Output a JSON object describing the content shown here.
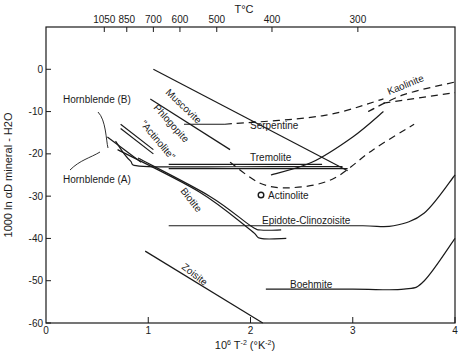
{
  "chart_data": {
    "type": "line",
    "title": "",
    "xlabel": "10^6 T^-2 (°K^-2)",
    "ylabel": "1000 ln αD mineral - H2O",
    "top_axis_label": "T°C",
    "xlim": [
      0,
      4
    ],
    "ylim": [
      -60,
      10
    ],
    "grid": false,
    "legend": "none (curves labeled inline)",
    "x_ticks": [
      0,
      1,
      2,
      3,
      4
    ],
    "x_tick_labels": [
      "0",
      "1",
      "2",
      "3",
      "4"
    ],
    "y_ticks": [
      0,
      -10,
      -20,
      -30,
      -40,
      -50,
      -60
    ],
    "y_tick_labels": [
      "0",
      "-10",
      "-20",
      "-30",
      "-40",
      "-50",
      "-60"
    ],
    "top_ticks": [
      {
        "label": "1050",
        "x": 0.57
      },
      {
        "label": "850",
        "x": 0.79
      },
      {
        "label": "700",
        "x": 1.05
      },
      {
        "label": "600",
        "x": 1.31
      },
      {
        "label": "500",
        "x": 1.67
      },
      {
        "label": "400",
        "x": 2.21
      },
      {
        "label": "300",
        "x": 3.05
      }
    ],
    "series": [
      {
        "name": "Muscovite",
        "style": "solid",
        "points": [
          [
            1.05,
            0
          ],
          [
            2.95,
            -24
          ]
        ]
      },
      {
        "name": "Phlogopite",
        "style": "solid",
        "points": [
          [
            1.02,
            -7
          ],
          [
            1.8,
            -19
          ]
        ]
      },
      {
        "name": "\"Actinolite\"",
        "style": "solid",
        "points": [
          [
            0.73,
            -13
          ],
          [
            1.05,
            -19
          ]
        ]
      },
      {
        "name": "\"Actinolite\" (second line)",
        "style": "solid",
        "points": [
          [
            0.73,
            -14
          ],
          [
            1.05,
            -20
          ]
        ]
      },
      {
        "name": "Hornblende (B)",
        "style": "solid",
        "points": [
          [
            0.68,
            -17
          ],
          [
            0.82,
            -21.5
          ],
          [
            1.0,
            -23
          ],
          [
            2.2,
            -23
          ],
          [
            2.9,
            -23
          ]
        ]
      },
      {
        "name": "Hornblende (A)",
        "style": "solid",
        "points": [
          [
            0.6,
            -16
          ],
          [
            0.93,
            -22
          ]
        ]
      },
      {
        "name": "Biotite",
        "style": "solid",
        "points": [
          [
            0.7,
            -19
          ],
          [
            1.5,
            -29
          ],
          [
            2.0,
            -38
          ],
          [
            2.1,
            -40
          ],
          [
            2.35,
            -40
          ]
        ]
      },
      {
        "name": "Biotite (second branch)",
        "style": "solid",
        "points": [
          [
            0.9,
            -21
          ],
          [
            1.6,
            -30
          ],
          [
            2.0,
            -37
          ],
          [
            2.1,
            -38
          ],
          [
            2.3,
            -38
          ]
        ]
      },
      {
        "name": "Tremolite",
        "style": "solid",
        "points": [
          [
            1.2,
            -22.5
          ],
          [
            2.7,
            -22.5
          ]
        ]
      },
      {
        "name": "Tremolite (lower)",
        "style": "solid",
        "points": [
          [
            1.2,
            -23.5
          ],
          [
            2.95,
            -23.5
          ]
        ]
      },
      {
        "name": "Serpentine",
        "style": "solid",
        "points": [
          [
            1.35,
            -13
          ],
          [
            1.75,
            -13
          ]
        ]
      },
      {
        "name": "Serpentine (extrapolated)",
        "style": "dashed",
        "points": [
          [
            1.75,
            -13
          ],
          [
            2.7,
            -11
          ],
          [
            3.3,
            -7
          ]
        ]
      },
      {
        "name": "Kaolinite",
        "style": "dashed",
        "points": [
          [
            3.15,
            -10
          ],
          [
            3.5,
            -6
          ],
          [
            4.0,
            -3
          ]
        ]
      },
      {
        "name": "Kaolinite (upper)",
        "style": "dashed",
        "points": [
          [
            3.3,
            -8
          ],
          [
            4.0,
            -5.5
          ]
        ]
      },
      {
        "name": "Hydrous mineral curve (solid to dashed)",
        "style": "solid",
        "points": [
          [
            2.2,
            -25
          ],
          [
            2.6,
            -22
          ],
          [
            3.0,
            -16
          ],
          [
            3.3,
            -10
          ]
        ]
      },
      {
        "name": "Hydrous mineral curve (dashed U)",
        "style": "dashed",
        "points": [
          [
            1.8,
            -22
          ],
          [
            2.1,
            -27
          ],
          [
            2.4,
            -28
          ],
          [
            2.8,
            -26
          ],
          [
            3.2,
            -19
          ],
          [
            3.6,
            -13
          ]
        ]
      },
      {
        "name": "Epidote-Clinozoisite",
        "style": "solid",
        "points": [
          [
            1.2,
            -37
          ],
          [
            2.5,
            -37
          ],
          [
            3.1,
            -37
          ],
          [
            3.4,
            -37
          ],
          [
            3.7,
            -34
          ],
          [
            4.0,
            -25
          ]
        ]
      },
      {
        "name": "Zoisite",
        "style": "solid",
        "points": [
          [
            0.97,
            -43
          ],
          [
            2.12,
            -60
          ]
        ]
      },
      {
        "name": "Boehmite",
        "style": "solid",
        "points": [
          [
            2.15,
            -52
          ],
          [
            3.0,
            -52
          ],
          [
            3.5,
            -52
          ],
          [
            3.7,
            -50
          ],
          [
            4.0,
            -40
          ]
        ]
      }
    ],
    "annotations": [
      {
        "text": "Actinolite",
        "marker": "open-circle",
        "x": 2.4,
        "y": -31
      }
    ]
  },
  "labels": {
    "top_axis_title": "T°C",
    "x_axis_title": "10",
    "x_axis_title_sup": "6",
    "x_axis_title_rest": " T",
    "x_axis_title_sup2": "-2",
    "x_axis_title_tail": " (°K",
    "x_axis_title_sup3": "-2",
    "x_axis_title_close": ")",
    "y_axis_title": "1000 ln αD mineral - H2O",
    "muscovite": "Muscovite",
    "phlogopite": "Phlogopite",
    "actinolite_quoted": "\"Actinolite\"",
    "hornblende_b": "Hornblende (B)",
    "hornblende_a": "Hornblende (A)",
    "biotite": "Biotite",
    "serpentine": "Serpentine",
    "kaolinite": "Kaolinite",
    "tremolite": "Tremolite",
    "actinolite": "Actinolite",
    "epidote": "Epidote-Clinozoisite",
    "zoisite": "Zoisite",
    "boehmite": "Boehmite"
  }
}
